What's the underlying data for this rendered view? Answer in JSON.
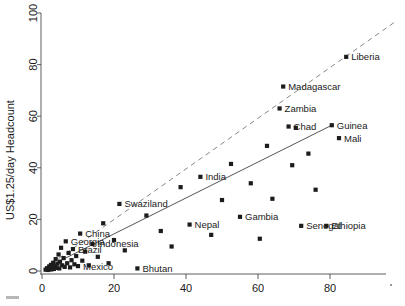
{
  "chart_data": {
    "type": "scatter",
    "title": "",
    "xlabel": "",
    "ylabel": "US$1.25/day Headcount",
    "xlim": [
      -2,
      98
    ],
    "ylim": [
      -4,
      104
    ],
    "xticks": [
      0,
      20,
      40,
      60,
      80
    ],
    "yticks": [
      0,
      20,
      40,
      60,
      80,
      100
    ],
    "grid": false,
    "legend": "none",
    "marker": "filled-square",
    "marker_color": "#1c1c1c",
    "lines": [
      {
        "name": "regression-fit",
        "style": "solid",
        "color": "#555555",
        "x": [
          0.5,
          80.5
        ],
        "y": [
          0.8,
          56.5
        ]
      },
      {
        "name": "reference-line",
        "style": "dashed",
        "color": "#888888",
        "x": [
          0.5,
          98.0
        ],
        "y": [
          0.8,
          96.5
        ]
      }
    ],
    "points": [
      {
        "x": 1.0,
        "y": 0.5,
        "label": ""
      },
      {
        "x": 1.4,
        "y": 1.1,
        "label": ""
      },
      {
        "x": 1.7,
        "y": 0.4,
        "label": ""
      },
      {
        "x": 2.0,
        "y": 1.8,
        "label": ""
      },
      {
        "x": 2.2,
        "y": 0.9,
        "label": ""
      },
      {
        "x": 2.5,
        "y": 2.4,
        "label": ""
      },
      {
        "x": 2.6,
        "y": 0.6,
        "label": ""
      },
      {
        "x": 2.9,
        "y": 1.5,
        "label": ""
      },
      {
        "x": 3.1,
        "y": 3.2,
        "label": ""
      },
      {
        "x": 3.3,
        "y": 0.8,
        "label": ""
      },
      {
        "x": 3.6,
        "y": 2.0,
        "label": ""
      },
      {
        "x": 3.8,
        "y": 4.6,
        "label": ""
      },
      {
        "x": 4.0,
        "y": 1.2,
        "label": ""
      },
      {
        "x": 4.3,
        "y": 2.8,
        "label": ""
      },
      {
        "x": 4.6,
        "y": 6.4,
        "label": ""
      },
      {
        "x": 4.8,
        "y": 1.0,
        "label": ""
      },
      {
        "x": 5.0,
        "y": 3.6,
        "label": ""
      },
      {
        "x": 5.3,
        "y": 9.0,
        "label": ""
      },
      {
        "x": 5.6,
        "y": 2.2,
        "label": ""
      },
      {
        "x": 6.0,
        "y": 5.0,
        "label": ""
      },
      {
        "x": 6.3,
        "y": 1.6,
        "label": ""
      },
      {
        "x": 6.6,
        "y": 11.5,
        "label": "Georgia"
      },
      {
        "x": 7.0,
        "y": 3.0,
        "label": ""
      },
      {
        "x": 7.4,
        "y": 7.0,
        "label": ""
      },
      {
        "x": 7.8,
        "y": 1.4,
        "label": ""
      },
      {
        "x": 8.2,
        "y": 4.2,
        "label": ""
      },
      {
        "x": 8.6,
        "y": 8.5,
        "label": "Brazil"
      },
      {
        "x": 9.0,
        "y": 2.6,
        "label": ""
      },
      {
        "x": 9.5,
        "y": 5.8,
        "label": ""
      },
      {
        "x": 10.0,
        "y": 1.9,
        "label": "Mexico"
      },
      {
        "x": 10.6,
        "y": 14.5,
        "label": "China"
      },
      {
        "x": 11.2,
        "y": 4.0,
        "label": ""
      },
      {
        "x": 12.0,
        "y": 7.5,
        "label": ""
      },
      {
        "x": 13.0,
        "y": 2.2,
        "label": ""
      },
      {
        "x": 14.0,
        "y": 10.5,
        "label": "Indonesia"
      },
      {
        "x": 15.5,
        "y": 5.5,
        "label": ""
      },
      {
        "x": 17.0,
        "y": 18.5,
        "label": ""
      },
      {
        "x": 18.5,
        "y": 3.0,
        "label": ""
      },
      {
        "x": 20.0,
        "y": 12.0,
        "label": ""
      },
      {
        "x": 21.5,
        "y": 26.0,
        "label": "Swaziland"
      },
      {
        "x": 23.0,
        "y": 8.0,
        "label": ""
      },
      {
        "x": 26.5,
        "y": 1.0,
        "label": "Bhutan"
      },
      {
        "x": 29.0,
        "y": 21.5,
        "label": ""
      },
      {
        "x": 33.0,
        "y": 15.5,
        "label": ""
      },
      {
        "x": 36.0,
        "y": 9.5,
        "label": ""
      },
      {
        "x": 38.5,
        "y": 32.5,
        "label": ""
      },
      {
        "x": 41.0,
        "y": 18.0,
        "label": "Nepal"
      },
      {
        "x": 44.0,
        "y": 36.5,
        "label": "India"
      },
      {
        "x": 47.0,
        "y": 14.0,
        "label": ""
      },
      {
        "x": 50.0,
        "y": 27.5,
        "label": ""
      },
      {
        "x": 52.5,
        "y": 41.5,
        "label": ""
      },
      {
        "x": 55.0,
        "y": 21.0,
        "label": "Gambia"
      },
      {
        "x": 58.0,
        "y": 34.0,
        "label": ""
      },
      {
        "x": 60.5,
        "y": 12.5,
        "label": ""
      },
      {
        "x": 62.5,
        "y": 48.5,
        "label": ""
      },
      {
        "x": 64.0,
        "y": 28.0,
        "label": ""
      },
      {
        "x": 66.0,
        "y": 63.0,
        "label": "Zambia"
      },
      {
        "x": 67.0,
        "y": 71.5,
        "label": "Madagascar"
      },
      {
        "x": 68.5,
        "y": 56.0,
        "label": "Chad"
      },
      {
        "x": 69.5,
        "y": 41.0,
        "label": ""
      },
      {
        "x": 70.5,
        "y": 55.5,
        "label": ""
      },
      {
        "x": 72.0,
        "y": 17.5,
        "label": "Senegal"
      },
      {
        "x": 74.0,
        "y": 45.5,
        "label": ""
      },
      {
        "x": 76.0,
        "y": 31.5,
        "label": ""
      },
      {
        "x": 79.0,
        "y": 17.5,
        "label": "Ethiopia"
      },
      {
        "x": 80.5,
        "y": 56.5,
        "label": "Guinea"
      },
      {
        "x": 82.5,
        "y": 51.5,
        "label": "Mali"
      },
      {
        "x": 84.5,
        "y": 83.0,
        "label": "Liberia"
      }
    ],
    "labeled_points": [
      {
        "label": "Madagascar",
        "x": 67.0,
        "y": 71.5
      },
      {
        "label": "Liberia",
        "x": 84.5,
        "y": 83.0
      },
      {
        "label": "Zambia",
        "x": 66.0,
        "y": 63.0
      },
      {
        "label": "Chad",
        "x": 68.5,
        "y": 56.0
      },
      {
        "label": "Guinea",
        "x": 80.5,
        "y": 56.5
      },
      {
        "label": "Mali",
        "x": 82.5,
        "y": 51.5
      },
      {
        "label": "Swaziland",
        "x": 21.5,
        "y": 26.0
      },
      {
        "label": "India",
        "x": 44.0,
        "y": 36.5
      },
      {
        "label": "China",
        "x": 10.6,
        "y": 14.5
      },
      {
        "label": "Gambia",
        "x": 55.0,
        "y": 21.0
      },
      {
        "label": "Senegal",
        "x": 72.0,
        "y": 17.5
      },
      {
        "label": "Ethiopia",
        "x": 79.0,
        "y": 17.5
      },
      {
        "label": "Nepal",
        "x": 41.0,
        "y": 18.0
      },
      {
        "label": "Georgia",
        "x": 6.6,
        "y": 11.5
      },
      {
        "label": "Indonesia",
        "x": 14.0,
        "y": 10.5
      },
      {
        "label": "Brazil",
        "x": 8.6,
        "y": 8.5
      },
      {
        "label": "Mexico",
        "x": 10.0,
        "y": 1.9
      },
      {
        "label": "Bhutan",
        "x": 26.5,
        "y": 1.0
      }
    ]
  },
  "axis": {
    "y_title": "US$1.25/day Headcount",
    "x_tick_labels": [
      "0",
      "20",
      "40",
      "60",
      "80"
    ],
    "y_tick_labels": [
      "0",
      "20",
      "40",
      "60",
      "80",
      "100"
    ]
  },
  "colors": {
    "marker": "#1c1c1c",
    "axis": "#4d4d4d",
    "fit_solid": "#555555",
    "fit_dashed": "#888888",
    "text": "#1a1a1a",
    "background": "#ffffff"
  }
}
